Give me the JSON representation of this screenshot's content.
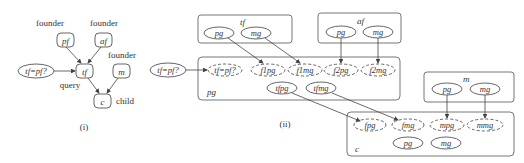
{
  "panel_i": {
    "caption": "(i)",
    "nodes": {
      "pf": "pf",
      "af": "af",
      "tf": "tf",
      "m": "m",
      "c": "c",
      "query_node": "tf=pf?"
    },
    "labels": {
      "pf_role": "founder",
      "af_role": "founder",
      "m_role": "founder",
      "tf_role": "query",
      "c_role": "child"
    }
  },
  "panel_ii": {
    "caption": "(ii)",
    "query_node": "tf=pf?",
    "boxes": {
      "tf": {
        "label": "tf",
        "nodes": [
          "pg",
          "mg"
        ]
      },
      "af": {
        "label": "af",
        "nodes": [
          "pg",
          "mg"
        ]
      },
      "pg": {
        "label": "pg",
        "dashed_nodes": [
          "tf=pf?",
          "f1pg",
          "f1mg",
          "f2pg",
          "f2mg"
        ],
        "nodes": [
          "tfpg",
          "tfmg"
        ]
      },
      "m": {
        "label": "m",
        "nodes": [
          "pg",
          "mg"
        ]
      },
      "c": {
        "label": "c",
        "dashed_nodes": [
          "fpg",
          "fmg",
          "mpg",
          "mmg"
        ],
        "nodes": [
          "pg",
          "mg"
        ]
      }
    }
  }
}
